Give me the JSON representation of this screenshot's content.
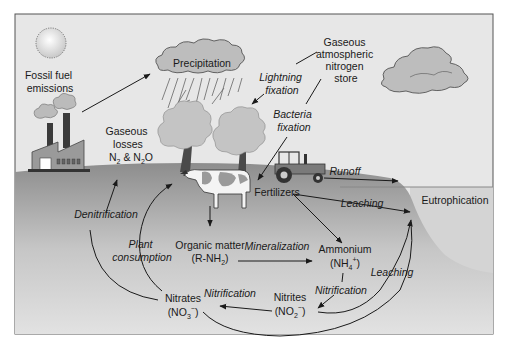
{
  "diagram": {
    "colors": {
      "sky": "#e6e6e6",
      "ground_top": "#8f8f8f",
      "ground_bottom": "#dcdcdc",
      "water": "#d2d2d2",
      "frame": "#555555",
      "cloud": "#bdbdbd",
      "tree": "#c4c4c4",
      "text": "#1a1a1a"
    },
    "labels": {
      "fossil_fuel": [
        "Fossil fuel",
        "emissions"
      ],
      "precipitation": "Precipitation",
      "atmospheric_store": [
        "Gaseous",
        "atmospheric",
        "nitrogen",
        "store"
      ],
      "lightning_fixation": [
        "Lightning",
        "fixation"
      ],
      "bacteria_fixation": [
        "Bacteria",
        "fixation"
      ],
      "gaseous_losses": [
        "Gaseous",
        "losses"
      ],
      "gaseous_losses_formula": {
        "a": "N",
        "a_sub": "2",
        "mid": " & N",
        "b_sub": "2",
        "b": "O"
      },
      "runoff": "Runoff",
      "fertilizers": "Fertilizers",
      "leaching_top": "Leaching",
      "eutrophication": "Eutrophication",
      "denitrification": "Denitrification",
      "plant_consumption": [
        "Plant",
        "consumption"
      ],
      "organic_matter": "Organic matter",
      "organic_matter_formula": {
        "pre": "(R-NH",
        "sub": "2",
        "post": ")"
      },
      "mineralization": "Mineralization",
      "ammonium": "Ammonium",
      "ammonium_formula": {
        "pre": "(NH",
        "sub": "4",
        "sup": "+",
        "post": ")"
      },
      "leaching_right": "Leaching",
      "nitrification_upper": "Nitrification",
      "nitrification_lower": "Nitrification",
      "nitrites": "Nitrites",
      "nitrites_formula": {
        "pre": "(NO",
        "sub": "2",
        "sup": "−",
        "post": ")"
      },
      "nitrates": "Nitrates",
      "nitrates_formula": {
        "pre": "(NO",
        "sub": "3",
        "sup": "−",
        "post": ")"
      }
    },
    "illustrations": [
      "sun-icon",
      "factory-icon",
      "rain-cloud-icon",
      "cloud-icon",
      "tree-icon",
      "tree-icon",
      "cow-icon",
      "tractor-icon"
    ]
  }
}
